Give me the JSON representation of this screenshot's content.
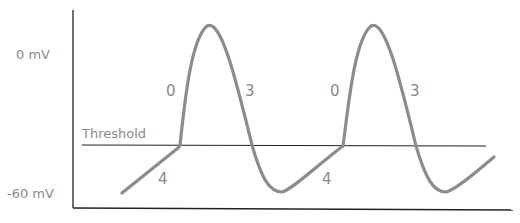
{
  "diagram": {
    "type": "pacemaker-action-potential",
    "y_labels": {
      "top": "0 mV",
      "bottom": "-60 mV"
    },
    "threshold_label": "Threshold",
    "phase_labels": {
      "cycle1": {
        "upstroke": "0",
        "repolarization": "3",
        "diastolic": "4"
      },
      "cycle2": {
        "upstroke": "0",
        "repolarization": "3",
        "diastolic": "4"
      }
    },
    "colors": {
      "curve": "#8c8c8c",
      "axis": "#222222",
      "text": "#8a8a8a"
    }
  }
}
